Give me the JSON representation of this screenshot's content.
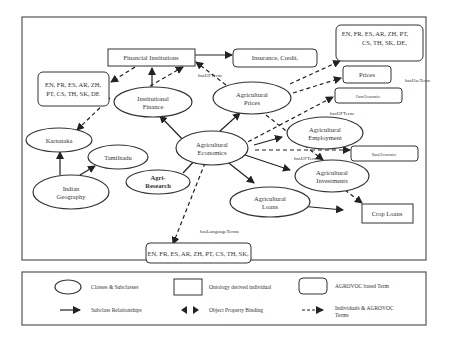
{
  "diagram": {
    "nodes": {
      "financial_institutions": "Financial Institutions",
      "insurance_credit": "Insurance, Credit,",
      "lang_top_left": [
        "EN, FR, ES, AR, ZH,",
        "PT, CS, TH, SK, DE"
      ],
      "lang_top_right": [
        "EN, FR, ES, AR, ZH, PT,",
        "CS, TH, SK, DE,"
      ],
      "prices": "Prices",
      "farm_economics": "Farm Economics",
      "rural_economics": "Rural Economics",
      "crop_loans": "Crop Loans",
      "lang_bottom": "EN, FR, ES, AR, ZH, PT, CS, TH, SK,",
      "institutional_finance": [
        "Institutional",
        "Finance"
      ],
      "agricultural_prices": [
        "Agricultural",
        "Prices"
      ],
      "karnataka": "Karnataka",
      "tamilnadu": "Tamilnadu",
      "indian_geography": [
        "Indian",
        "Geography"
      ],
      "agri_research": [
        "Agri-",
        "Research"
      ],
      "agricultural_economics": [
        "Agricultural",
        "Economics"
      ],
      "agricultural_employment": [
        "Agricultural",
        "Employment"
      ],
      "agricultural_investments": [
        "Agricultural",
        "Investments"
      ],
      "agricultural_loans": [
        "Agricultural",
        "Loans"
      ]
    },
    "edge_labels": {
      "has_uf_term_1": "hasUFTerm",
      "has_use_term": "hasUseTerm",
      "has_uf_term_2": "hasUFTerm",
      "has_uf_term_3": "hasUFTerm",
      "has_language_terms": "hasLanguageTerms"
    }
  },
  "legend": {
    "classes": "Classes & Subclasses",
    "ontology_individual": "Ontology derived individual",
    "agrovoc_term": "AGROVOC based Term",
    "subclass_rel": "Subclass Relationships",
    "object_property": "Object Property Binding",
    "individuals_agrovoc": [
      "Individuals & AGROVOC",
      "Terms"
    ]
  }
}
